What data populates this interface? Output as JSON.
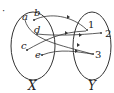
{
  "bullet": "·",
  "sets": {
    "X": {
      "label": "X",
      "elements": [
        "a",
        "b",
        "c",
        "d",
        "e"
      ]
    },
    "Y": {
      "label": "Y",
      "elements": [
        "1",
        "2",
        "3"
      ]
    }
  },
  "mapping": [
    {
      "from": "a",
      "to": "3"
    },
    {
      "from": "b",
      "to": "1"
    },
    {
      "from": "c",
      "to": "1"
    },
    {
      "from": "d",
      "to": "2"
    },
    {
      "from": "e",
      "to": "3"
    }
  ],
  "colors": {
    "stroke": "#333333",
    "text": "#222222"
  }
}
